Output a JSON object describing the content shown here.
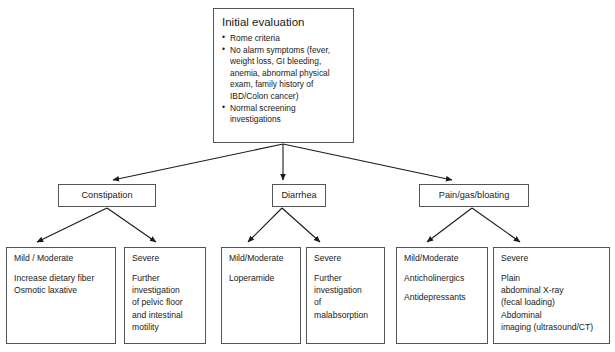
{
  "diagram": {
    "title_node": {
      "heading": "Initial evaluation",
      "bullets": [
        "Rome criteria",
        "No alarm symptoms (fever, weight loss, GI bleeding, anemia, abnormal physical exam, family history of IBD/Colon cancer)",
        "Normal screening investigations"
      ]
    },
    "branches": [
      {
        "label": "Constipation"
      },
      {
        "label": "Diarrhea"
      },
      {
        "label": "Pain/gas/bloating"
      }
    ],
    "leaves": [
      {
        "severity": "Mild / Moderate",
        "lines": [
          "Increase dietary fiber",
          "Osmotic laxative"
        ]
      },
      {
        "severity": "Severe",
        "lines": [
          "Further",
          "investigation",
          "of pelvic floor",
          "and intestinal",
          "motility"
        ]
      },
      {
        "severity": "Mild/Moderate",
        "lines": [
          "Loperamide"
        ]
      },
      {
        "severity": "Severe",
        "lines": [
          "Further",
          "investigation",
          "of",
          "malabsorption"
        ]
      },
      {
        "severity": "Mild/Moderate",
        "lines": [
          "Anticholinergics",
          "",
          "Antidepressants"
        ]
      },
      {
        "severity": "Severe",
        "lines": [
          "Plain",
          "abdominal X-ray",
          "(fecal loading)",
          "Abdominal",
          "imaging (ultrasound/CT)"
        ]
      }
    ],
    "colors": {
      "box_border": "#555555",
      "connector": "#1a1a1a",
      "background": "#ffffff",
      "text": "#1a1a1a"
    }
  }
}
